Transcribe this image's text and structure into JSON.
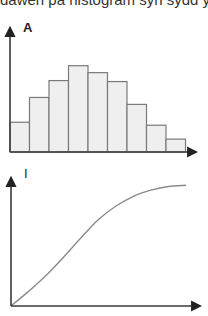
{
  "caption": "dawen pa histogram syn sydd yn",
  "colors": {
    "axis": "#3a3a3a",
    "bar_fill": "#efefef",
    "bar_stroke": "#7a7a7a",
    "curve": "#8a8a8a"
  },
  "chart_data": [
    {
      "type": "bar",
      "title": "",
      "ylabel": "A",
      "xlabel": "",
      "categories": [
        "1",
        "2",
        "3",
        "4",
        "5",
        "6",
        "7",
        "8",
        "9"
      ],
      "values": [
        30,
        55,
        72,
        87,
        80,
        71,
        48,
        27,
        13
      ],
      "ylim": [
        0,
        125
      ],
      "grid": false,
      "legend": null
    },
    {
      "type": "line",
      "title": "",
      "ylabel": "I",
      "xlabel": "",
      "x": [
        0,
        10,
        20,
        30,
        40,
        50,
        60,
        70,
        80,
        90,
        100
      ],
      "series": [
        {
          "name": "cumulative",
          "values": [
            0,
            12,
            25,
            40,
            56,
            71,
            82,
            90,
            95,
            98,
            99
          ]
        }
      ],
      "ylim": [
        0,
        105
      ],
      "grid": false,
      "legend": null
    }
  ]
}
